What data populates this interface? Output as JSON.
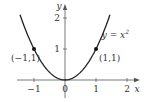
{
  "chart_data": {
    "type": "line",
    "title": "",
    "xlabel": "x",
    "ylabel": "y",
    "xlim": [
      -1.45,
      2.2
    ],
    "ylim": [
      0,
      2.3
    ],
    "grid": false,
    "x_ticks": [
      {
        "value": -1,
        "label": "-1"
      },
      {
        "value": 0,
        "label": "0"
      },
      {
        "value": 1,
        "label": "1"
      },
      {
        "value": 2,
        "label": "2"
      }
    ],
    "y_ticks": [
      {
        "value": 1,
        "label": "1"
      },
      {
        "value": 2,
        "label": "2"
      }
    ],
    "series": [
      {
        "name": "y = x^2",
        "function": "x^2",
        "domain": [
          -1.45,
          1.45
        ]
      }
    ],
    "points": [
      {
        "x": -1,
        "y": 1,
        "label": "(-1, 1)"
      },
      {
        "x": 1,
        "y": 1,
        "label": "(1, 1)"
      }
    ],
    "annotations": [
      {
        "text": "y = x",
        "superscript": "2",
        "x": 1.25,
        "y": 1.45
      }
    ]
  }
}
